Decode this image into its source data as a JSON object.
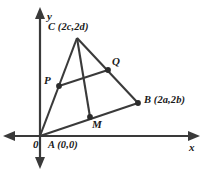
{
  "figure": {
    "background_color": "#ffffff",
    "stroke_color": "#3a3a3a",
    "text_color": "#1a1a1a"
  },
  "axes": {
    "x_label": "x",
    "y_label": "y",
    "origin_label": "0",
    "x_axis": {
      "x1": 3,
      "y1": 136,
      "x2": 200,
      "y2": 136,
      "arrows": "both"
    },
    "y_axis": {
      "x1": 40,
      "y1": 8,
      "x2": 40,
      "y2": 168,
      "arrows": "both"
    }
  },
  "points": [
    {
      "name": "A",
      "label": "A",
      "coord_label": "(0,0)",
      "x": 40,
      "y": 136,
      "dot": false
    },
    {
      "name": "B",
      "label": "B",
      "coord_label": "(2a,2b)",
      "x": 138,
      "y": 103,
      "dot": true
    },
    {
      "name": "C",
      "label": "C",
      "coord_label": "(2c,2d)",
      "x": 77,
      "y": 38,
      "dot": false
    },
    {
      "name": "P",
      "label": "P",
      "coord_label": "",
      "x": 59,
      "y": 86,
      "dot": true
    },
    {
      "name": "Q",
      "label": "Q",
      "coord_label": "",
      "x": 108,
      "y": 70,
      "dot": true
    },
    {
      "name": "M",
      "label": "M",
      "coord_label": "",
      "x": 90,
      "y": 117,
      "dot": true
    }
  ],
  "segments": [
    {
      "name": "side-AC",
      "from": "A",
      "to": "C"
    },
    {
      "name": "side-CB",
      "from": "C",
      "to": "B"
    },
    {
      "name": "side-AB",
      "from": "A",
      "to": "B"
    },
    {
      "name": "midsegment-PQ",
      "from": "P",
      "to": "Q"
    },
    {
      "name": "median-CM",
      "from": "C",
      "to": "M"
    }
  ],
  "labels": {
    "C_full": "C (2c,2d)",
    "B_full": "B (2a,2b)",
    "A_full": "A (0,0)",
    "P": "P",
    "Q": "Q",
    "M": "M",
    "origin": "0",
    "x": "x",
    "y": "y"
  }
}
